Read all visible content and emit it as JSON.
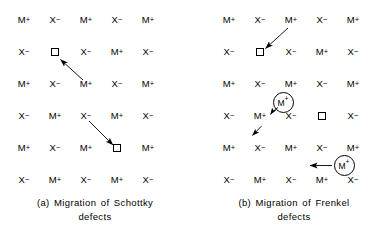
{
  "figure": {
    "ink_color": "#000000",
    "background_color": "#ffffff"
  },
  "symbols": {
    "cation": "M",
    "cation_charge": "+",
    "anion": "X",
    "anion_charge": "−",
    "vacancy": "□",
    "interstitial_label": "M",
    "interstitial_charge": "+"
  },
  "panels": [
    {
      "id": "a",
      "name": "schottky",
      "caption_line1": "(a)  Migration  of  Schottky",
      "caption_line2": "defects",
      "rows": 6,
      "cols": 5,
      "grid": [
        [
          "M+",
          "X-",
          "M+",
          "X-",
          "M+"
        ],
        [
          "X-",
          "VAC",
          "X-",
          "M+",
          "X-"
        ],
        [
          "M+",
          "X-",
          "M+",
          "X-",
          "M+"
        ],
        [
          "X-",
          "M+",
          "X-",
          "M+",
          "X-"
        ],
        [
          "M+",
          "X-",
          "M+",
          "VAC",
          "M+"
        ],
        [
          "X-",
          "M+",
          "X-",
          "M+",
          "X-"
        ]
      ],
      "vacancies": [
        {
          "row": 2,
          "col": 2,
          "replaces": "M+"
        },
        {
          "row": 5,
          "col": 4,
          "replaces": "X-"
        }
      ],
      "arrows": [
        {
          "name": "cation-hop-to-vacancy",
          "from_row": 3,
          "from_col": 3,
          "to_row": 2,
          "to_col": 2,
          "style": "straight"
        },
        {
          "name": "anion-hop-to-vacancy",
          "from_row": 4,
          "from_col": 3,
          "to_row": 5,
          "to_col": 4,
          "style": "straight"
        }
      ],
      "interstitials": []
    },
    {
      "id": "b",
      "name": "frenkel",
      "caption_line1": "(b) Migration  of  Frenkel",
      "caption_line2": "defects",
      "rows": 6,
      "cols": 5,
      "grid": [
        [
          "M+",
          "X-",
          "M+",
          "X-",
          "M+"
        ],
        [
          "X-",
          "VAC",
          "X-",
          "M+",
          "X-"
        ],
        [
          "M+",
          "X-",
          "M+",
          "X-",
          "M+"
        ],
        [
          "X-",
          "M+",
          "X-",
          "VAC",
          "X-"
        ],
        [
          "M+",
          "X-",
          "M+",
          "X-",
          "M+"
        ],
        [
          "X-",
          "M+",
          "X-",
          "M+",
          "X-"
        ]
      ],
      "vacancies": [
        {
          "row": 2,
          "col": 2,
          "replaces": "M+"
        },
        {
          "row": 4,
          "col": 4,
          "replaces": "M+"
        }
      ],
      "arrows": [
        {
          "name": "cation-hop-to-vacancy",
          "from_row": 1,
          "from_col": 3,
          "to_row": 2,
          "to_col": 2,
          "style": "straight"
        },
        {
          "name": "interstitial-curved-hop",
          "style": "curved"
        },
        {
          "name": "interstitial-continuation-hop",
          "style": "straight-short"
        },
        {
          "name": "interstitial-lateral-hop",
          "style": "straight-horizontal"
        }
      ],
      "interstitials": [
        {
          "name": "interstitial-cation-upper",
          "label": "M",
          "charge": "+",
          "near_row": 3.55,
          "near_col": 2.85
        },
        {
          "name": "interstitial-cation-lower",
          "label": "M",
          "charge": "+",
          "near_row": 5.5,
          "near_col": 4.55
        }
      ]
    }
  ]
}
